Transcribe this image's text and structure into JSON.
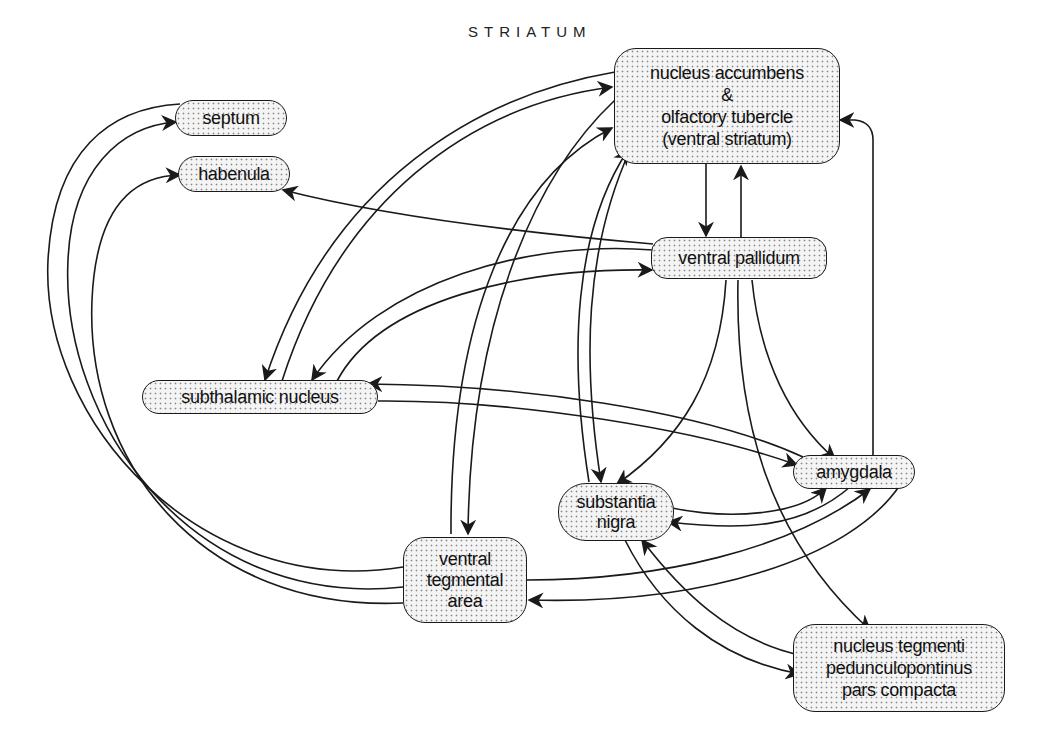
{
  "diagram": {
    "title": "STRIATUM",
    "nodes": {
      "nucleus_accumbens": {
        "label": "nucleus accumbens\n&\nolfactory tubercle\n(ventral striatum)"
      },
      "septum": {
        "label": "septum"
      },
      "habenula": {
        "label": "habenula"
      },
      "ventral_pallidum": {
        "label": "ventral pallidum"
      },
      "subthalamic_nucleus": {
        "label": "subthalamic nucleus"
      },
      "amygdala": {
        "label": "amygdala"
      },
      "substantia_nigra": {
        "label": "substantia\nnigra"
      },
      "ventral_tegmental_area": {
        "label": "ventral\ntegmental\narea"
      },
      "nucleus_tegmenti": {
        "label": "nucleus tegmenti\npedunculopontinus\npars compacta"
      }
    },
    "edges": [
      {
        "from": "nucleus accumbens",
        "to": "ventral pallidum"
      },
      {
        "from": "ventral pallidum",
        "to": "nucleus accumbens"
      },
      {
        "from": "amygdala",
        "to": "nucleus accumbens"
      },
      {
        "from": "ventral tegmental area",
        "to": "septum"
      },
      {
        "from": "ventral tegmental area",
        "to": "habenula"
      },
      {
        "from": "ventral pallidum",
        "to": "habenula"
      },
      {
        "from": "nucleus accumbens",
        "to": "subthalamic nucleus"
      },
      {
        "from": "subthalamic nucleus",
        "to": "nucleus accumbens"
      },
      {
        "from": "ventral pallidum",
        "to": "subthalamic nucleus"
      },
      {
        "from": "subthalamic nucleus",
        "to": "ventral pallidum"
      },
      {
        "from": "amygdala",
        "to": "subthalamic nucleus"
      },
      {
        "from": "subthalamic nucleus",
        "to": "amygdala"
      },
      {
        "from": "nucleus accumbens",
        "to": "ventral tegmental area"
      },
      {
        "from": "ventral tegmental area",
        "to": "nucleus accumbens"
      },
      {
        "from": "nucleus accumbens",
        "to": "substantia nigra"
      },
      {
        "from": "substantia nigra",
        "to": "nucleus accumbens"
      },
      {
        "from": "ventral pallidum",
        "to": "substantia nigra"
      },
      {
        "from": "ventral pallidum",
        "to": "amygdala"
      },
      {
        "from": "ventral pallidum",
        "to": "nucleus tegmenti pedunculopontinus"
      },
      {
        "from": "substantia nigra",
        "to": "amygdala"
      },
      {
        "from": "amygdala",
        "to": "substantia nigra"
      },
      {
        "from": "ventral tegmental area",
        "to": "amygdala"
      },
      {
        "from": "amygdala",
        "to": "ventral tegmental area"
      },
      {
        "from": "substantia nigra",
        "to": "nucleus tegmenti pedunculopontinus"
      },
      {
        "from": "nucleus tegmenti pedunculopontinus",
        "to": "substantia nigra"
      }
    ]
  }
}
